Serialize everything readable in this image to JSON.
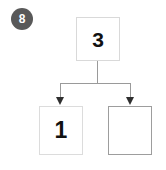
{
  "diagram": {
    "type": "binary-tree-step",
    "title": "",
    "step_badge": {
      "label": "8",
      "color": "#595959",
      "text_color": "#ffffff"
    },
    "nodes": [
      {
        "id": "root",
        "label": "3",
        "border_color": "#d9d9d9",
        "fill": "#ffffff",
        "empty": false
      },
      {
        "id": "left-child",
        "label": "1",
        "border_color": "#dcdcdc",
        "fill": "#ffffff",
        "empty": false
      },
      {
        "id": "right-child",
        "label": "",
        "border_color": "#9d9d9d",
        "fill": "#ffffff",
        "empty": true
      }
    ],
    "edges": [
      {
        "from": "root",
        "to": "left-child",
        "arrow": "down",
        "color": "#9a9a9a"
      },
      {
        "from": "root",
        "to": "right-child",
        "arrow": "down",
        "color": "#9a9a9a"
      }
    ],
    "arrow_color": "#2f2f2f",
    "background": "#ffffff"
  }
}
